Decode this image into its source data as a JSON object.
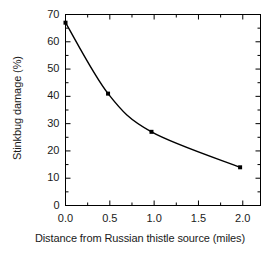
{
  "chart_data": {
    "type": "line",
    "title": "",
    "subtitle": "",
    "xlabel": "Distance from Russian thistle source (miles)",
    "ylabel": "Stinkbug damage (%)",
    "x": [
      0.0,
      0.48,
      0.97,
      1.97
    ],
    "values": [
      67,
      41,
      27,
      14
    ],
    "series": [
      {
        "name": "Stinkbug damage",
        "x": [
          0.0,
          0.48,
          0.97,
          1.97
        ],
        "values": [
          67,
          41,
          27,
          14
        ]
      }
    ],
    "xlim": [
      0.0,
      2.2
    ],
    "ylim": [
      0,
      70
    ],
    "xticks": [
      0.0,
      0.5,
      1.0,
      1.5,
      2.0
    ],
    "xtick_labels": [
      "0.0",
      "0.5",
      "1.0",
      "1.5",
      "2.0"
    ],
    "yticks": [
      0,
      10,
      20,
      30,
      40,
      50,
      60,
      70
    ],
    "ytick_labels": [
      "0",
      "10",
      "20",
      "30",
      "40",
      "50",
      "60",
      "70"
    ],
    "x_minor_ticks": [
      0.25,
      0.75,
      1.25,
      1.75
    ],
    "y_minor_ticks": [
      5,
      15,
      25,
      35,
      45,
      55,
      65
    ],
    "grid": false,
    "legend": false,
    "legend_position": "none",
    "marker": "square",
    "line_color": "#000000",
    "marker_color": "#000000",
    "frame_color": "#000000",
    "background_color": "#ffffff",
    "annotations": []
  },
  "axes": {
    "x_tick_labels": [
      "0.0",
      "0.5",
      "1.0",
      "1.5",
      "2.0"
    ],
    "y_tick_labels": [
      "0",
      "10",
      "20",
      "30",
      "40",
      "50",
      "60",
      "70"
    ],
    "x_axis_title": "Distance from Russian thistle source (miles)",
    "y_axis_title": "Stinkbug damage (%)"
  }
}
